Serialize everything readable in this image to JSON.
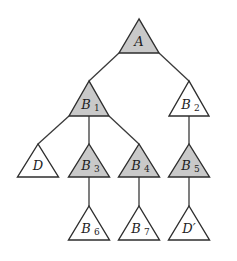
{
  "diagram": {
    "type": "tree",
    "colors": {
      "shaded_fill": "#c9c9c9",
      "plain_fill": "#ffffff",
      "stroke": "#2e2e2e"
    },
    "nodes": [
      {
        "id": "A",
        "base": "A",
        "sub": "",
        "shaded": true,
        "apex": [
          139,
          19
        ],
        "width": 40,
        "height": 34
      },
      {
        "id": "B1",
        "base": "B",
        "sub": "1",
        "shaded": true,
        "apex": [
          89,
          81
        ],
        "width": 40,
        "height": 35
      },
      {
        "id": "B2",
        "base": "B",
        "sub": "2",
        "shaded": false,
        "apex": [
          189,
          81
        ],
        "width": 40,
        "height": 35
      },
      {
        "id": "D",
        "base": "D",
        "sub": "",
        "shaded": false,
        "apex": [
          38,
          144
        ],
        "width": 41,
        "height": 33
      },
      {
        "id": "B3",
        "base": "B",
        "sub": "3",
        "shaded": true,
        "apex": [
          89,
          144
        ],
        "width": 41,
        "height": 33
      },
      {
        "id": "B4",
        "base": "B",
        "sub": "4",
        "shaded": true,
        "apex": [
          139,
          144
        ],
        "width": 41,
        "height": 33
      },
      {
        "id": "B5",
        "base": "B",
        "sub": "5",
        "shaded": true,
        "apex": [
          189,
          144
        ],
        "width": 41,
        "height": 33
      },
      {
        "id": "B6",
        "base": "B",
        "sub": "6",
        "shaded": false,
        "apex": [
          89,
          206
        ],
        "width": 41,
        "height": 34
      },
      {
        "id": "B7",
        "base": "B",
        "sub": "7",
        "shaded": false,
        "apex": [
          139,
          206
        ],
        "width": 41,
        "height": 34
      },
      {
        "id": "Dp",
        "base": "D′",
        "sub": "",
        "shaded": false,
        "apex": [
          189,
          206
        ],
        "width": 41,
        "height": 34
      }
    ],
    "edges": [
      {
        "from": "A",
        "to": "B1",
        "line": [
          119,
          53,
          89,
          81
        ]
      },
      {
        "from": "A",
        "to": "B2",
        "line": [
          159,
          53,
          189,
          81
        ]
      },
      {
        "from": "B1",
        "to": "D",
        "line": [
          69,
          116,
          38,
          144
        ]
      },
      {
        "from": "B1",
        "to": "B3",
        "line": [
          89,
          116,
          89,
          144
        ]
      },
      {
        "from": "B1",
        "to": "B4",
        "line": [
          109,
          116,
          139,
          144
        ]
      },
      {
        "from": "B2",
        "to": "B5",
        "line": [
          189,
          116,
          189,
          144
        ]
      },
      {
        "from": "B3",
        "to": "B6",
        "line": [
          89,
          177,
          89,
          206
        ]
      },
      {
        "from": "B4",
        "to": "B7",
        "line": [
          139,
          177,
          139,
          206
        ]
      },
      {
        "from": "B5",
        "to": "Dp",
        "line": [
          189,
          177,
          189,
          206
        ]
      }
    ]
  }
}
